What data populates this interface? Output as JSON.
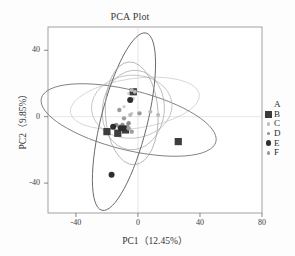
{
  "chart_data": {
    "type": "scatter",
    "title": "PCA Plot",
    "xlabel": "PC1（12.45%）",
    "ylabel": "PC2（9.85%）",
    "xlim": [
      -58,
      80
    ],
    "ylim": [
      -58,
      54
    ],
    "xticks": [
      -40,
      0,
      40,
      80
    ],
    "yticks": [
      40,
      0,
      -40
    ],
    "xtick_labels": [
      "-40",
      "0",
      "40",
      "80"
    ],
    "ytick_labels": [
      "40",
      "0",
      "-40"
    ],
    "grid": false,
    "legend_position": "right",
    "legend_entries": [
      {
        "label": "A",
        "marker": "none",
        "color": "#d8d8d8",
        "size": 0
      },
      {
        "label": "B",
        "marker": "square",
        "color": "#3a3a3a",
        "size": 4.0
      },
      {
        "label": "C",
        "marker": "circle",
        "color": "#bcbcbc",
        "size": 2.2
      },
      {
        "label": "D",
        "marker": "circle",
        "color": "#8f8f8f",
        "size": 2.4
      },
      {
        "label": "E",
        "marker": "circle",
        "color": "#2f2f2f",
        "size": 3.4
      },
      {
        "label": "F",
        "marker": "circle",
        "color": "#9a9a9a",
        "size": 2.4
      }
    ],
    "series": [
      {
        "name": "A",
        "color": "#cfcfcf",
        "marker": "circle",
        "size": 1.6,
        "points": [
          [
            -6,
            14
          ],
          [
            -3,
            11
          ],
          [
            -9,
            6
          ],
          [
            -4,
            2
          ]
        ]
      },
      {
        "name": "B",
        "color": "#3d3d3d",
        "marker": "square",
        "size": 3.6,
        "points": [
          [
            -20,
            -9
          ],
          [
            -13,
            -10
          ],
          [
            -8,
            -8
          ],
          [
            26,
            -15
          ],
          [
            -3,
            15
          ]
        ]
      },
      {
        "name": "C",
        "color": "#b9b9b9",
        "marker": "circle",
        "size": 2.0,
        "points": [
          [
            -4,
            16
          ],
          [
            -2,
            15
          ],
          [
            8,
            3
          ],
          [
            13,
            1
          ],
          [
            -5,
            1
          ]
        ]
      },
      {
        "name": "D",
        "color": "#8c8c8c",
        "marker": "circle",
        "size": 2.2,
        "points": [
          [
            -14,
            -5
          ],
          [
            -12,
            -6
          ],
          [
            -10,
            -5
          ],
          [
            -7,
            -6
          ],
          [
            -6,
            -4
          ]
        ]
      },
      {
        "name": "E",
        "color": "#2e2e2e",
        "marker": "circle",
        "size": 3.0,
        "points": [
          [
            -5,
            10
          ],
          [
            -17,
            -35
          ],
          [
            -11,
            -7
          ],
          [
            -9,
            -7
          ],
          [
            -16,
            -6
          ]
        ]
      },
      {
        "name": "F",
        "color": "#9d9d9d",
        "marker": "circle",
        "size": 2.2,
        "points": [
          [
            -12,
            4
          ],
          [
            -9,
            -1
          ],
          [
            1,
            2
          ],
          [
            -6,
            -7
          ],
          [
            -4,
            -9
          ]
        ]
      }
    ],
    "ellipses": [
      {
        "name": "ellipse-A",
        "cx": -2,
        "cy": 8,
        "rx": 42,
        "ry": 15,
        "angle": -8,
        "color": "#c9c9c9",
        "width": 0.7
      },
      {
        "name": "ellipse-B",
        "cx": -6,
        "cy": -2,
        "rx": 58,
        "ry": 18,
        "angle": 14,
        "color": "#6f6f6f",
        "width": 0.8
      },
      {
        "name": "ellipse-C",
        "cx": -4,
        "cy": 6,
        "rx": 26,
        "ry": 19,
        "angle": -4,
        "color": "#b0b0b0",
        "width": 0.7
      },
      {
        "name": "ellipse-D",
        "cx": -3,
        "cy": 4,
        "rx": 20,
        "ry": 24,
        "angle": 6,
        "color": "#a6a6a6",
        "width": 0.7
      },
      {
        "name": "ellipse-E",
        "cx": -9,
        "cy": -3,
        "rx": 15,
        "ry": 55,
        "angle": 14,
        "color": "#5e5e5e",
        "width": 0.85
      },
      {
        "name": "ellipse-F",
        "cx": -4,
        "cy": 2,
        "rx": 17,
        "ry": 31,
        "angle": -3,
        "color": "#9b9b9b",
        "width": 0.7
      }
    ],
    "reference_lines": [
      {
        "name": "vline-zero",
        "x": 0,
        "color": "#d3d3d3"
      },
      {
        "name": "hline-zero",
        "y": 0,
        "color": "#d3d3d3"
      }
    ]
  }
}
